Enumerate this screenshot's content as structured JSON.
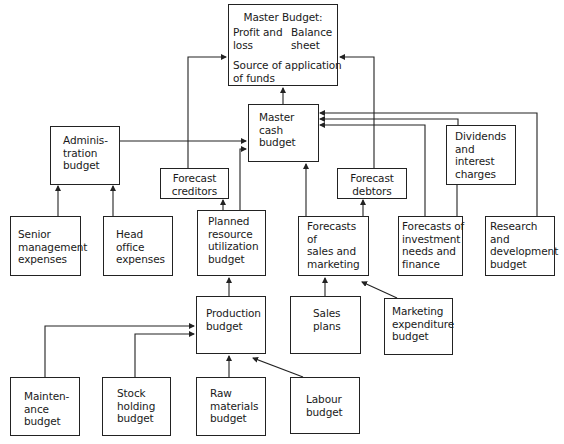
{
  "diagram": {
    "type": "budget hierarchy flowchart",
    "nodes": {
      "master_budget": {
        "title": "Master Budget:",
        "left": [
          "Profit and",
          "loss"
        ],
        "right": [
          "Balance",
          "sheet"
        ],
        "bottom": [
          "Source of application",
          "of funds"
        ]
      },
      "master_cash": {
        "lines": [
          "Master",
          "cash",
          "budget"
        ]
      },
      "administration": {
        "lines": [
          "Adminis-",
          "tration",
          "budget"
        ]
      },
      "forecast_creditors": {
        "lines": [
          "Forecast",
          "creditors"
        ]
      },
      "forecast_debtors": {
        "lines": [
          "Forecast",
          "debtors"
        ]
      },
      "dividends": {
        "lines": [
          "Dividends",
          "and",
          "interest",
          "charges"
        ]
      },
      "senior_management": {
        "lines": [
          "Senior",
          "management",
          "expenses"
        ]
      },
      "head_office": {
        "lines": [
          "Head",
          "office",
          "expenses"
        ]
      },
      "planned_resource": {
        "lines": [
          "Planned",
          "resource",
          "utilization",
          "budget"
        ]
      },
      "forecasts_sales": {
        "lines": [
          "Forecasts",
          "of",
          "sales and",
          "marketing"
        ]
      },
      "forecasts_investment": {
        "lines": [
          "Forecasts of",
          "investment",
          "needs and",
          "finance"
        ]
      },
      "research": {
        "lines": [
          "Research",
          "and",
          "development",
          "budget"
        ]
      },
      "production": {
        "lines": [
          "Production",
          "budget"
        ]
      },
      "sales_plans": {
        "lines": [
          "Sales",
          "plans"
        ]
      },
      "marketing_expenditure": {
        "lines": [
          "Marketing",
          "expenditure",
          "budget"
        ]
      },
      "maintenance": {
        "lines": [
          "Mainten-",
          "ance",
          "budget"
        ]
      },
      "stock_holding": {
        "lines": [
          "Stock",
          "holding",
          "budget"
        ]
      },
      "raw_materials": {
        "lines": [
          "Raw",
          "materials",
          "budget"
        ]
      },
      "labour": {
        "lines": [
          "Labour",
          "budget"
        ]
      }
    },
    "edges": [
      [
        "Master cash budget",
        "Master Budget"
      ],
      [
        "Forecast creditors",
        "Master Budget"
      ],
      [
        "Forecast debtors",
        "Master Budget"
      ],
      [
        "Administration budget",
        "Master cash budget"
      ],
      [
        "Planned resource utilization budget",
        "Master cash budget"
      ],
      [
        "Forecasts of sales and marketing",
        "Master cash budget"
      ],
      [
        "Dividends and interest charges",
        "Master cash budget"
      ],
      [
        "Forecasts of investment needs and finance",
        "Master cash budget"
      ],
      [
        "Research and development budget",
        "Master cash budget"
      ],
      [
        "Senior management expenses",
        "Administration budget"
      ],
      [
        "Head office expenses",
        "Administration budget"
      ],
      [
        "Planned resource utilization budget",
        "Forecast creditors"
      ],
      [
        "Forecasts of sales and marketing",
        "Forecast debtors"
      ],
      [
        "Production budget",
        "Planned resource utilization budget"
      ],
      [
        "Sales plans",
        "Forecasts of sales and marketing"
      ],
      [
        "Marketing expenditure budget",
        "Forecasts of sales and marketing"
      ],
      [
        "Maintenance budget",
        "Production budget"
      ],
      [
        "Stock holding budget",
        "Production budget"
      ],
      [
        "Raw materials budget",
        "Production budget"
      ],
      [
        "Labour budget",
        "Production budget"
      ]
    ]
  }
}
